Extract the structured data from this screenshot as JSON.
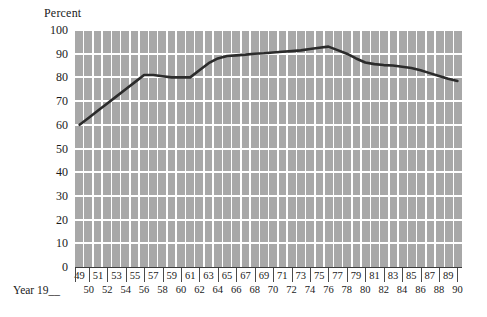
{
  "chart_data": {
    "type": "line",
    "title": "",
    "ylabel": "Percent",
    "xlabel": "Year 19__",
    "ylim": [
      0,
      100
    ],
    "yticks": [
      0,
      10,
      20,
      30,
      40,
      50,
      60,
      70,
      80,
      90,
      100
    ],
    "xlim": [
      49,
      90
    ],
    "grid": "horizontal white gridlines over grey vertical year bars",
    "legend": "none",
    "series_color": "#2b2b2b",
    "plot_background": "#a8a8a8",
    "x_tick_labels_top": [
      "49",
      "51",
      "53",
      "55",
      "57",
      "59",
      "61",
      "63",
      "65",
      "67",
      "69",
      "71",
      "73",
      "75",
      "77",
      "79",
      "81",
      "83",
      "85",
      "87",
      "89"
    ],
    "x_tick_labels_bottom": [
      "50",
      "52",
      "54",
      "56",
      "58",
      "60",
      "62",
      "64",
      "66",
      "68",
      "70",
      "72",
      "74",
      "76",
      "78",
      "80",
      "82",
      "84",
      "86",
      "88",
      "90"
    ],
    "x": [
      49,
      50,
      51,
      52,
      53,
      54,
      55,
      56,
      57,
      58,
      59,
      60,
      61,
      62,
      63,
      64,
      65,
      66,
      67,
      68,
      69,
      70,
      71,
      72,
      73,
      74,
      75,
      76,
      77,
      78,
      79,
      80,
      81,
      82,
      83,
      84,
      85,
      86,
      87,
      88,
      89,
      90
    ],
    "values": [
      60,
      63,
      66,
      69,
      72,
      75,
      78,
      81,
      81,
      80.5,
      80,
      80,
      80,
      83,
      86,
      88,
      89,
      89.3,
      89.6,
      90,
      90.2,
      90.5,
      90.8,
      91.1,
      91.4,
      92,
      92.5,
      93,
      91.5,
      90,
      88,
      86.3,
      85.6,
      85.2,
      85,
      84.5,
      84,
      83,
      81.8,
      80.6,
      79.4,
      78.5
    ]
  },
  "axis": {
    "y_title": "Percent",
    "x_caption": "Year 19__"
  }
}
